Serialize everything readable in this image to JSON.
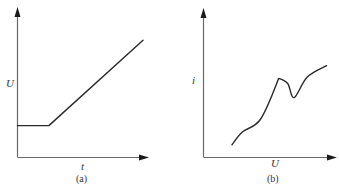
{
  "figure": {
    "panels": [
      {
        "id": "a",
        "caption": "(a)",
        "xlabel": "t",
        "ylabel": "U",
        "description": "Constant value then linear increase",
        "curve": {
          "type": "piecewise-linear",
          "points": [
            [
              0.0,
              0.25
            ],
            [
              0.25,
              0.25
            ],
            [
              1.0,
              0.92
            ]
          ]
        }
      },
      {
        "id": "b",
        "caption": "(b)",
        "xlabel": "U",
        "ylabel": "i",
        "description": "Rising curve with a sharp peak followed by a dip, then rising again",
        "curve": {
          "type": "smooth",
          "points": [
            [
              0.22,
              0.1
            ],
            [
              0.3,
              0.2
            ],
            [
              0.44,
              0.3
            ],
            [
              0.58,
              0.62
            ],
            [
              0.65,
              0.58
            ],
            [
              0.7,
              0.47
            ],
            [
              0.8,
              0.63
            ],
            [
              0.95,
              0.72
            ]
          ]
        }
      }
    ]
  }
}
